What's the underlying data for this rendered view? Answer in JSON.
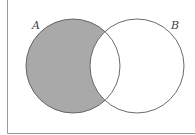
{
  "diagram": {
    "type": "venn",
    "sets": [
      {
        "name": "A",
        "label": "A",
        "shaded": true
      },
      {
        "name": "B",
        "label": "B",
        "shaded": false
      }
    ],
    "shaded_region": "A − B",
    "colors": {
      "shade": "#a9a9a9",
      "outline": "#5a5a5a",
      "frame": "#9a9a9a",
      "background": "#ffffff"
    }
  }
}
